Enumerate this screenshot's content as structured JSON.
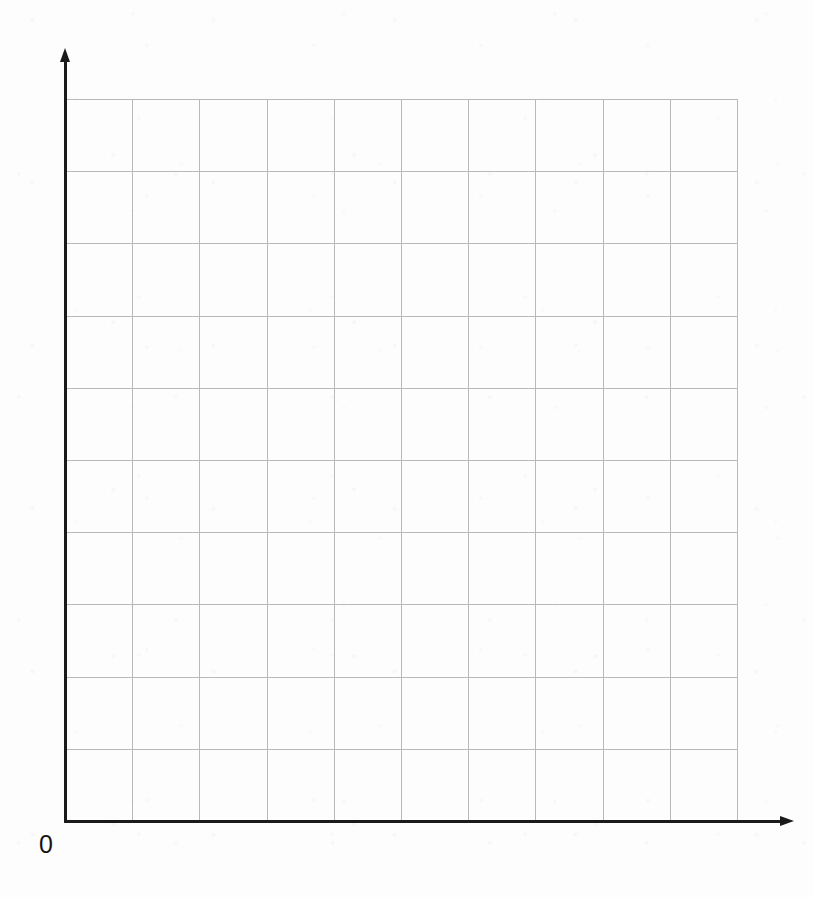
{
  "figure": {
    "title": "",
    "origin_label": "0",
    "background_color": "#fdfdfd",
    "axis_color": "#1a1a1a",
    "grid_color": "#b9b9b9"
  },
  "chart_data": {
    "type": "scatter",
    "title": "",
    "subtitle": "",
    "xlabel": "",
    "ylabel": "",
    "annotations": [
      "0"
    ],
    "legend": [],
    "legend_position": "none",
    "grid": true,
    "grid_columns": 10,
    "grid_rows": 10,
    "xlim": [
      0,
      10
    ],
    "ylim": [
      0,
      10
    ],
    "x_tick_labels": [],
    "y_tick_labels": [],
    "series": [],
    "x": [],
    "values": [],
    "note": "Empty coordinate grid: blank 10 by 10 squared plotting area with arrowed x and y axes and a single origin label."
  },
  "geometry": {
    "plot_left": 65,
    "plot_top": 99,
    "plot_width": 672,
    "plot_height": 722,
    "y_axis_top": 60,
    "x_axis_right": 782,
    "origin_x": 65,
    "origin_y": 821,
    "cell_width": 67.2,
    "cell_height": 72.2
  }
}
